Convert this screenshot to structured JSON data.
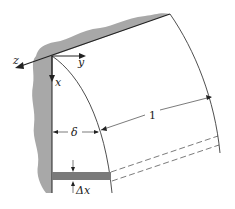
{
  "diagram": {
    "axes": {
      "x_label": "x",
      "y_label": "y",
      "z_label": "z"
    },
    "dimensions": {
      "film_thickness_label": "δ",
      "unit_width_label": "1",
      "element_height_label": "Δx"
    },
    "colors": {
      "wall": "#a8a8a8",
      "element": "#7a7a7a",
      "line": "#222222",
      "background": "#ffffff"
    }
  }
}
